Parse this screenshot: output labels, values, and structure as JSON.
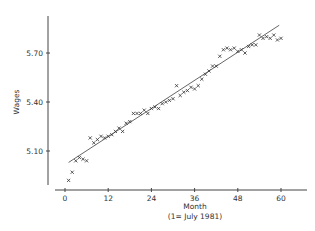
{
  "chart_data": {
    "type": "scatter",
    "title": "",
    "xlabel": "Month",
    "xlabel_sub": "(1= July 1981)",
    "ylabel": "Wages",
    "xlim": [
      -4,
      67
    ],
    "ylim": [
      4.88,
      5.92
    ],
    "x_ticks": [
      0,
      12,
      24,
      36,
      48,
      60
    ],
    "x_tick_labels": [
      "0",
      "12",
      "24",
      "36",
      "48",
      "60"
    ],
    "y_ticks": [
      5.1,
      5.4,
      5.7
    ],
    "y_tick_labels": [
      "5.10",
      "5.40",
      "5.70"
    ],
    "grid": false,
    "legend": null,
    "marker": "x",
    "series": [
      {
        "name": "Wages",
        "type": "scatter",
        "x": [
          1,
          2,
          3,
          4,
          5,
          6,
          7,
          8,
          9,
          10,
          11,
          12,
          13,
          14,
          15,
          16,
          17,
          18,
          19,
          20,
          21,
          22,
          23,
          24,
          25,
          26,
          27,
          28,
          29,
          30,
          31,
          32,
          33,
          34,
          35,
          36,
          37,
          38,
          39,
          40,
          41,
          42,
          43,
          44,
          45,
          46,
          47,
          48,
          49,
          50,
          51,
          52,
          53,
          54,
          55,
          56,
          57,
          58,
          59,
          60
        ],
        "y": [
          4.92,
          4.97,
          5.04,
          5.06,
          5.05,
          5.04,
          5.18,
          5.15,
          5.17,
          5.19,
          5.18,
          5.19,
          5.2,
          5.22,
          5.24,
          5.22,
          5.27,
          5.28,
          5.33,
          5.33,
          5.33,
          5.35,
          5.33,
          5.36,
          5.37,
          5.36,
          5.39,
          5.4,
          5.41,
          5.42,
          5.5,
          5.44,
          5.46,
          5.47,
          5.49,
          5.48,
          5.5,
          5.54,
          5.57,
          5.59,
          5.62,
          5.62,
          5.68,
          5.72,
          5.73,
          5.72,
          5.73,
          5.71,
          5.72,
          5.7,
          5.74,
          5.75,
          5.75,
          5.81,
          5.79,
          5.8,
          5.79,
          5.81,
          5.78,
          5.79
        ]
      },
      {
        "name": "Linear trend",
        "type": "line",
        "x": [
          1,
          59.5
        ],
        "y": [
          5.03,
          5.87
        ]
      }
    ]
  }
}
